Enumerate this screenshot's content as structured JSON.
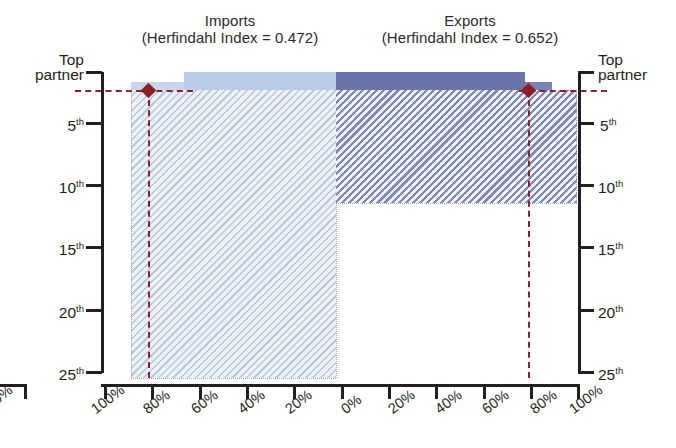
{
  "panels": {
    "imports": {
      "title": "Imports",
      "subtitle": "(Herfindahl Index = 0.472)",
      "herfindahl_index": 0.472
    },
    "exports": {
      "title": "Exports",
      "subtitle": "(Herfindahl Index = 0.652)",
      "herfindahl_index": 0.652
    }
  },
  "axes": {
    "y_left_labels": [
      "Top partner",
      "5th",
      "10th",
      "15th",
      "20th",
      "25th"
    ],
    "y_right_labels": [
      "Top partner",
      "5th",
      "10th",
      "15th",
      "20th",
      "25th"
    ],
    "y_top_line1": "Top",
    "y_top_line2": "partner",
    "x_left_labels": [
      "100%",
      "80%",
      "60%",
      "40%",
      "20%",
      "0%"
    ],
    "x_right_labels": [
      "0%",
      "20%",
      "40%",
      "60%",
      "80%",
      "100%"
    ],
    "fragment_x_label": "100%"
  },
  "colors": {
    "imports_hatch": "#b9c8e0",
    "imports_solid": "#bbcce6",
    "exports_hatch": "#7d89b8",
    "exports_solid": "#6b75ab",
    "reference_red": "#8c2027",
    "axis_black": "#231f20"
  },
  "chart_data": {
    "type": "area",
    "subtitle": "",
    "xlabel": "Cumulative share of trade",
    "ylabel": "Partner rank",
    "grid": false,
    "legend_position": "none",
    "orientation": "mirrored-horizontal",
    "x_axis": {
      "left_panel_ticks": [
        100,
        80,
        60,
        40,
        20,
        0
      ],
      "right_panel_ticks": [
        0,
        20,
        40,
        60,
        80,
        100
      ],
      "unit": "percent",
      "direction_left": "reversed"
    },
    "y_axis": {
      "ticks": [
        "Top partner",
        "5th",
        "10th",
        "15th",
        "20th",
        "25th"
      ],
      "tick_ranks": [
        1,
        5,
        10,
        15,
        20,
        25
      ],
      "range": [
        1,
        25
      ],
      "direction": "increasing-downward"
    },
    "annotations": [
      {
        "name": "imports-reference-marker",
        "panel": "imports",
        "rank": 1,
        "value_percent": 80,
        "marker": "diamond",
        "color": "#8c2027",
        "style": "dashed-crosshair"
      },
      {
        "name": "exports-reference-marker",
        "panel": "exports",
        "rank": 1,
        "value_percent": 83,
        "marker": "diamond",
        "color": "#8c2027",
        "style": "dashed-crosshair"
      }
    ],
    "series": [
      {
        "name": "Imports",
        "herfindahl_index": 0.472,
        "panel": "left",
        "fill": "#b9c8e0",
        "pattern": "diagonal-hatch",
        "top_partner_share_percent": 48,
        "max_rank_with_data": 25,
        "cumulative_extent_percent": 100,
        "points": [
          {
            "rank": 1,
            "cumulative_percent": 48
          },
          {
            "rank": 5,
            "cumulative_percent": 84
          },
          {
            "rank": 10,
            "cumulative_percent": 93
          },
          {
            "rank": 15,
            "cumulative_percent": 97
          },
          {
            "rank": 20,
            "cumulative_percent": 99
          },
          {
            "rank": 25,
            "cumulative_percent": 100
          }
        ]
      },
      {
        "name": "Exports",
        "herfindahl_index": 0.652,
        "panel": "right",
        "fill": "#7d89b8",
        "pattern": "diagonal-hatch",
        "top_partner_share_percent": 79,
        "max_rank_with_data": 11,
        "cumulative_extent_percent": 100,
        "points": [
          {
            "rank": 1,
            "cumulative_percent": 79
          },
          {
            "rank": 5,
            "cumulative_percent": 96
          },
          {
            "rank": 10,
            "cumulative_percent": 100
          },
          {
            "rank": 11,
            "cumulative_percent": 100
          }
        ]
      }
    ]
  }
}
